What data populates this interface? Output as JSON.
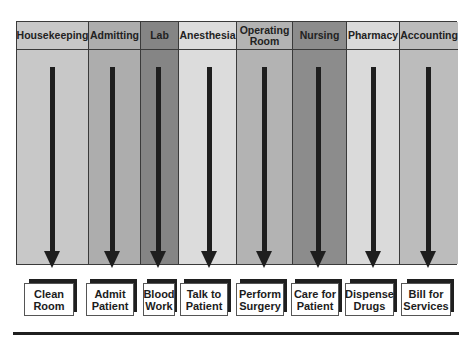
{
  "diagram": {
    "type": "swimlane-process",
    "departments": [
      {
        "label": "Housekeeping",
        "task": "Clean Room",
        "fill": "#c8c8c8"
      },
      {
        "label": "Admitting",
        "task": "Admit Patient",
        "fill": "#adadad"
      },
      {
        "label": "Lab",
        "task": "Blood Work",
        "fill": "#858585"
      },
      {
        "label": "Anesthesia",
        "task": "Talk to Patient",
        "fill": "#dcdcdc"
      },
      {
        "label": "Operating Room",
        "task": "Perform Surgery",
        "fill": "#b3b3b3"
      },
      {
        "label": "Nursing",
        "task": "Care for Patient",
        "fill": "#8c8c8c"
      },
      {
        "label": "Pharmacy",
        "task": "Dispense Drugs",
        "fill": "#dadada"
      },
      {
        "label": "Accounting",
        "task": "Bill for Services",
        "fill": "#bcbcbc"
      }
    ]
  }
}
